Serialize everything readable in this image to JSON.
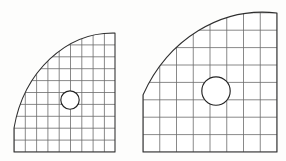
{
  "figure": {
    "type": "technical-line-drawing",
    "background_color": "#fdfdfc",
    "boundary_color": "#2f2f2f",
    "mesh_color": "#6b6b6b",
    "hole_stroke_color": "#232323",
    "hole_fill_color": "#ffffff",
    "panel_count": 2,
    "panels": [
      {
        "id": "left-panel",
        "label": "Left quarter plate",
        "shape": "quarter-disc",
        "corner_x": 14,
        "corner_y": 152,
        "right_edge_x": 115,
        "top_edge_y": 33,
        "arc_start_x": 14,
        "arc_start_y": 128,
        "arc_end_x": 115,
        "arc_end_y": 33,
        "arc_center_x": 14,
        "arc_center_y": 152,
        "arc_radius_x": 101,
        "arc_radius_y": 119,
        "grid_spacing_x": 11.3,
        "grid_spacing_y": 11.9,
        "grid_columns": 9,
        "grid_rows": 10,
        "hole": {
          "center_x": 70,
          "center_y": 100,
          "radius": 9.2,
          "label": "central hole"
        }
      },
      {
        "id": "right-panel",
        "label": "Right quarter plate",
        "shape": "quarter-disc",
        "corner_x": 143,
        "corner_y": 152,
        "right_edge_x": 277,
        "top_edge_y": 13,
        "arc_start_x": 143,
        "arc_start_y": 95,
        "arc_end_x": 277,
        "arc_end_y": 13,
        "arc_center_x": 143,
        "arc_center_y": 152,
        "arc_radius_x": 134,
        "arc_radius_y": 150,
        "grid_spacing_x": 16.75,
        "grid_spacing_y": 17.4,
        "grid_columns": 8,
        "grid_rows": 8,
        "hole": {
          "center_x": 216,
          "center_y": 91,
          "radius": 14.2,
          "label": "central hole"
        }
      }
    ]
  }
}
